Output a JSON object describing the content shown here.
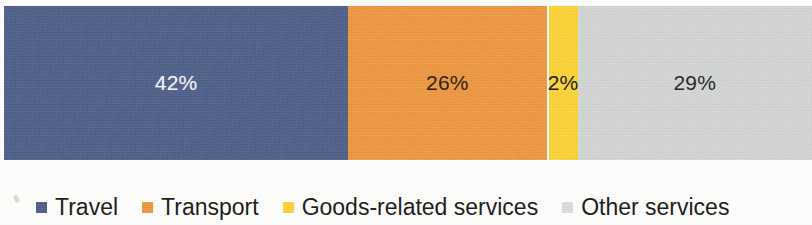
{
  "chart_data": {
    "type": "bar",
    "orientation": "horizontal",
    "stacked": true,
    "title": "",
    "subtitle": "",
    "xlabel": "",
    "ylabel": "",
    "categories": [
      ""
    ],
    "units": "percent",
    "total": 99,
    "xlim": [
      0,
      100
    ],
    "grid": false,
    "legend_position": "bottom-left",
    "series": [
      {
        "name": "Travel",
        "values": [
          42
        ],
        "label": "42%",
        "color": "#4b5c87",
        "label_color": "#eef1f6"
      },
      {
        "name": "Transport",
        "values": [
          26
        ],
        "label": "26%",
        "color": "#f0963c",
        "label_color": "#2d2416"
      },
      {
        "name": "Goods-related services",
        "values": [
          2
        ],
        "label": "2%",
        "color": "#ffd531",
        "label_color": "#231f16"
      },
      {
        "name": "Other services",
        "values": [
          29
        ],
        "label": "29%",
        "color": "#d5d7d7",
        "label_color": "#2a2a2a"
      }
    ]
  },
  "bar": {
    "segments": [
      {
        "name": "Travel",
        "value_label": "42%"
      },
      {
        "name": "Transport",
        "value_label": "26%"
      },
      {
        "name": "Goods-related services",
        "value_label": "2%"
      },
      {
        "name": "Other services",
        "value_label": "29%"
      }
    ]
  },
  "legend": {
    "items": [
      {
        "label": "Travel",
        "color": "#4b5c87"
      },
      {
        "label": "Transport",
        "color": "#f0963c"
      },
      {
        "label": "Goods-related services",
        "color": "#ffd531"
      },
      {
        "label": "Other services",
        "color": "#dcdedd"
      }
    ]
  }
}
